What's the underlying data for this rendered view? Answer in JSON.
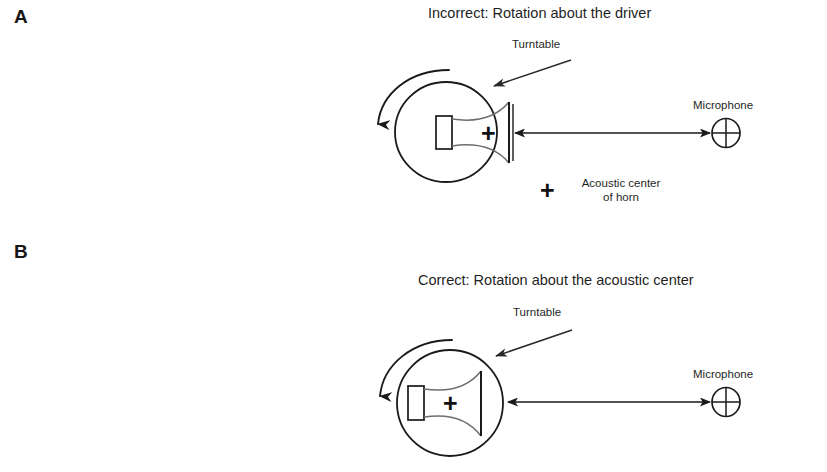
{
  "figure": {
    "background_color": "#ffffff",
    "ink_color": "#1a1a1a"
  },
  "panels": [
    {
      "letter": "A",
      "title": "Incorrect: Rotation about the driver",
      "turntable_label": "Turntable",
      "microphone_label": "Microphone",
      "acoustic_center_label_line1": "Acoustic center",
      "acoustic_center_label_line2": "of horn",
      "acoustic_center_marker": "+",
      "rotation_marker": "+",
      "legend_marker": "+"
    },
    {
      "letter": "B",
      "title": "Correct: Rotation about the acoustic center",
      "turntable_label": "Turntable",
      "microphone_label": "Microphone",
      "acoustic_center_marker": "+"
    }
  ]
}
